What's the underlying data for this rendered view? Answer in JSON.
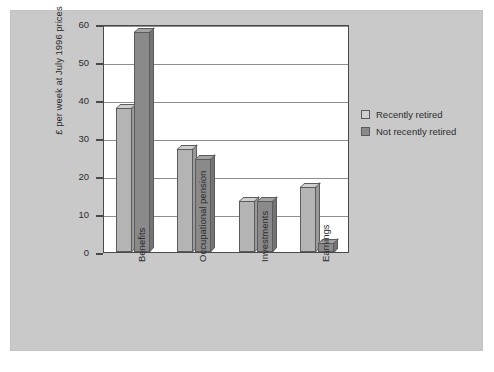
{
  "chart_data": {
    "type": "bar",
    "title": "",
    "subtitle": "",
    "xlabel": "",
    "ylabel": "£ per week at July 1996 prices",
    "ylim": [
      0,
      60
    ],
    "yticks": [
      0,
      10,
      20,
      30,
      40,
      50,
      60
    ],
    "ytick_labels": [
      "0",
      "10",
      "20",
      "30",
      "40",
      "50",
      "60"
    ],
    "grid": "horizontal",
    "legend_position": "right",
    "categories": [
      "Benefits",
      "Occupational pension",
      "Investments",
      "Earnings"
    ],
    "series": [
      {
        "name": "Recently retired",
        "color": "#b4b4b4",
        "values": [
          38,
          27,
          13.5,
          17
        ]
      },
      {
        "name": "Not recently retired",
        "color": "#8a8a8a",
        "values": [
          58,
          24.5,
          13.5,
          2.5
        ]
      }
    ],
    "annotations": []
  },
  "legend": {
    "items": [
      {
        "label": "Recently retired",
        "swatch": "light"
      },
      {
        "label": "Not recently retired",
        "swatch": "dark"
      }
    ]
  },
  "colors": {
    "panel_background": "#c9c9c9",
    "plot_background": "#ffffff",
    "axis": "#4a4a4a",
    "gridline": "#8d8d8d",
    "text": "#2b2b2b",
    "series_light": "#b4b4b4",
    "series_dark": "#8a8a8a"
  }
}
